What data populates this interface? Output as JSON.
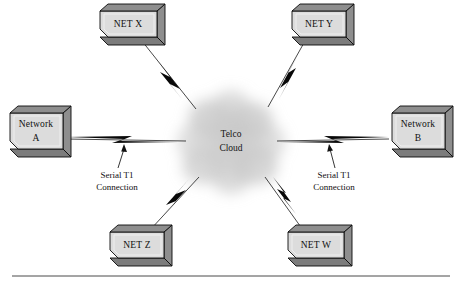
{
  "figure": {
    "background_color": "#ffffff",
    "width": 462,
    "height": 290
  },
  "cloud": {
    "name": "telco-cloud",
    "line1": "Telco",
    "line2": "Cloud",
    "fill_color": "#c9c9c9",
    "center_x": 231,
    "center_y": 142
  },
  "nodes": [
    {
      "id": "net-x",
      "label": "NET X",
      "position": "top-left",
      "front_x": 100,
      "front_y": 11,
      "front_w": 57,
      "front_h": 26,
      "text_x": 128,
      "text_y": 25
    },
    {
      "id": "net-y",
      "label": "NET Y",
      "position": "top-right",
      "front_x": 292,
      "front_y": 11,
      "front_w": 54,
      "front_h": 26,
      "text_x": 319,
      "text_y": 25
    },
    {
      "id": "network-a",
      "label_line1": "Network",
      "label_line2": "A",
      "position": "left",
      "front_x": 10,
      "front_y": 113,
      "front_w": 53,
      "front_h": 36,
      "text_x": 36,
      "text_y": 125
    },
    {
      "id": "network-b",
      "label_line1": "Network",
      "label_line2": "B",
      "position": "right",
      "front_x": 392,
      "front_y": 113,
      "front_w": 53,
      "front_h": 36,
      "text_x": 418,
      "text_y": 125
    },
    {
      "id": "net-z",
      "label": "NET Z",
      "position": "bottom-left",
      "front_x": 110,
      "front_y": 232,
      "front_w": 54,
      "front_h": 26,
      "text_x": 137,
      "text_y": 246
    },
    {
      "id": "net-w",
      "label": "NET W",
      "position": "bottom-right",
      "front_x": 288,
      "front_y": 232,
      "front_w": 56,
      "front_h": 26,
      "text_x": 316,
      "text_y": 246
    }
  ],
  "links": [
    {
      "id": "link-net-x",
      "from": "net-x",
      "to": "telco-cloud",
      "x1": 142,
      "y1": 41,
      "x2": 196,
      "y2": 109,
      "bolt": true
    },
    {
      "id": "link-net-y",
      "from": "net-y",
      "to": "telco-cloud",
      "x1": 305,
      "y1": 41,
      "x2": 268,
      "y2": 107,
      "bolt": true
    },
    {
      "id": "link-network-a",
      "from": "network-a",
      "to": "telco-cloud",
      "x1": 66,
      "y1": 140,
      "x2": 186,
      "y2": 140,
      "bolt": true
    },
    {
      "id": "link-network-b",
      "from": "network-b",
      "to": "telco-cloud",
      "x1": 389,
      "y1": 140,
      "x2": 277,
      "y2": 140,
      "bolt": true
    },
    {
      "id": "link-net-z",
      "from": "net-z",
      "to": "telco-cloud",
      "x1": 150,
      "y1": 230,
      "x2": 199,
      "y2": 177,
      "bolt": true
    },
    {
      "id": "link-net-w",
      "from": "net-w",
      "to": "telco-cloud",
      "x1": 303,
      "y1": 230,
      "x2": 265,
      "y2": 177,
      "bolt": true
    }
  ],
  "annotations": [
    {
      "id": "serial-t1-left",
      "line1": "Serial T1",
      "line2": "Connection",
      "text_x": 117,
      "text_y": 178,
      "arrow_from_x": 118,
      "arrow_from_y": 168,
      "arrow_to_x": 123,
      "arrow_to_y": 146
    },
    {
      "id": "serial-t1-right",
      "line1": "Serial T1",
      "line2": "Connection",
      "text_x": 334,
      "text_y": 178,
      "arrow_from_x": 335,
      "arrow_from_y": 168,
      "arrow_to_x": 331,
      "arrow_to_y": 146
    }
  ],
  "footer_rule": {
    "id": "footer-rule",
    "x1": 12,
    "x2": 450,
    "y": 276,
    "color": "#4a4a4a"
  },
  "palette": {
    "box_face": "#dcdcdc",
    "box_side": "#8e8e8e",
    "box_bottom": "#7c7c7c",
    "outline": "#0a0a0a",
    "cloud": "#c9c9c9",
    "line": "#1a1a1a"
  }
}
